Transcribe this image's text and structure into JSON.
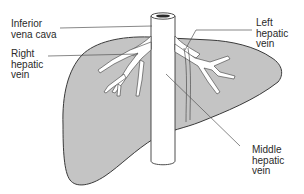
{
  "figure": {
    "colors": {
      "liver_fill": "#c4c4c4",
      "outline": "#3a3a3a",
      "vein_fill": "#ffffff",
      "leader_line": "#555555",
      "text": "#2a2a2a"
    }
  },
  "labels": {
    "ivc": "Inferior\nvena cava",
    "right_hepatic": "Right\nhepatic\nvein",
    "left_hepatic": "Left\nhepatic\nvein",
    "middle_hepatic": "Middle\nhepatic\nvein"
  }
}
